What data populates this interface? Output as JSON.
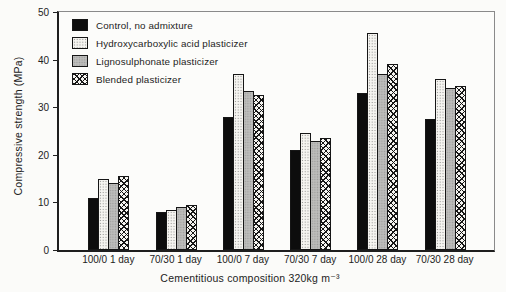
{
  "chart_data": {
    "type": "bar",
    "title": "",
    "xlabel": "Cementitious composition 320kg m⁻³",
    "ylabel": "Compressive strength (MPa)",
    "ylim": [
      0,
      50
    ],
    "y_tick_step": 10,
    "y_tick_labels": [
      "0",
      "10",
      "20",
      "30",
      "40",
      "50"
    ],
    "grid": false,
    "legend_position": "upper-left-inside",
    "categories": [
      "100/0 1 day",
      "70/30 1 day",
      "100/0 7 day",
      "70/30 7 day",
      "100/0 28 day",
      "70/30 28 day"
    ],
    "series": [
      {
        "name": "Control, no admixture",
        "pattern": "solid-black",
        "values": [
          11,
          8,
          28,
          21,
          33,
          27.5
        ]
      },
      {
        "name": "Hydroxycarboxylic acid plasticizer",
        "pattern": "stipple-white",
        "values": [
          15,
          8.5,
          37,
          24.5,
          45.5,
          36
        ]
      },
      {
        "name": "Lignosulphonate plasticizer",
        "pattern": "gray-dotted",
        "values": [
          14,
          9,
          33.5,
          23,
          37,
          34
        ]
      },
      {
        "name": "Blended plasticizer",
        "pattern": "crosshatch",
        "values": [
          15.5,
          9.5,
          32.5,
          23.5,
          39,
          34.5
        ]
      }
    ],
    "colors": {
      "bar_outline": "#161616",
      "solid_black": "#0d0d0d",
      "stipple_background": "#f6f5f1",
      "gray_fill": "#bdbdbb",
      "figure_background": "#fbfbf9"
    }
  }
}
